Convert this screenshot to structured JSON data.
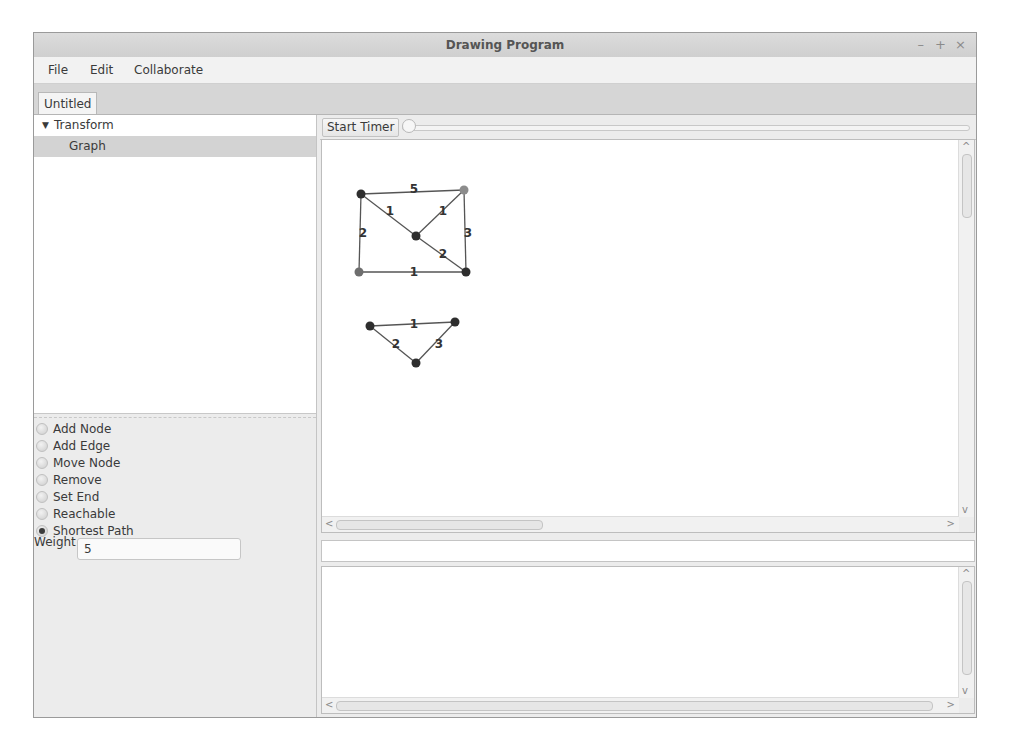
{
  "window": {
    "title": "Drawing Program",
    "controls": {
      "minimize": "–",
      "maximize": "+",
      "close": "×"
    }
  },
  "menubar": {
    "items": [
      "File",
      "Edit",
      "Collaborate"
    ]
  },
  "tabs": [
    {
      "label": "Untitled",
      "active": true
    }
  ],
  "tree": {
    "items": [
      {
        "label": "Transform",
        "expanded": true,
        "toggle": "▼",
        "level": 0,
        "selected": false
      },
      {
        "label": "Graph",
        "level": 1,
        "selected": true
      }
    ]
  },
  "tools": {
    "modes": [
      {
        "label": "Add Node",
        "selected": false
      },
      {
        "label": "Add Edge",
        "selected": false
      },
      {
        "label": "Move Node",
        "selected": false
      },
      {
        "label": "Remove",
        "selected": false
      },
      {
        "label": "Set End",
        "selected": false
      },
      {
        "label": "Reachable",
        "selected": false
      },
      {
        "label": "Shortest Path",
        "selected": true
      }
    ],
    "weight_label": "Weight",
    "weight_value": "5"
  },
  "toolbar": {
    "start_timer_label": "Start Timer",
    "slider_value": 0
  },
  "canvas": {
    "graphs": [
      {
        "nodes": [
          {
            "id": "a",
            "x": 39,
            "y": 54,
            "color": "#2e2e2e"
          },
          {
            "id": "b",
            "x": 142,
            "y": 50,
            "color": "#8c8c8c"
          },
          {
            "id": "c",
            "x": 94,
            "y": 96,
            "color": "#2e2e2e"
          },
          {
            "id": "d",
            "x": 37,
            "y": 132,
            "color": "#6e6e6e"
          },
          {
            "id": "e",
            "x": 144,
            "y": 132,
            "color": "#2e2e2e"
          }
        ],
        "edges": [
          {
            "from": "a",
            "to": "b",
            "weight": "5",
            "lx": 92,
            "ly": 49
          },
          {
            "from": "a",
            "to": "c",
            "weight": "1",
            "lx": 68,
            "ly": 71
          },
          {
            "from": "a",
            "to": "d",
            "weight": "2",
            "lx": 41,
            "ly": 93
          },
          {
            "from": "b",
            "to": "c",
            "weight": "1",
            "lx": 121,
            "ly": 71
          },
          {
            "from": "b",
            "to": "e",
            "weight": "3",
            "lx": 146,
            "ly": 93
          },
          {
            "from": "c",
            "to": "e",
            "weight": "2",
            "lx": 121,
            "ly": 114
          },
          {
            "from": "d",
            "to": "e",
            "weight": "1",
            "lx": 92,
            "ly": 132
          }
        ]
      },
      {
        "nodes": [
          {
            "id": "f",
            "x": 48,
            "y": 186,
            "color": "#2e2e2e"
          },
          {
            "id": "g",
            "x": 133,
            "y": 182,
            "color": "#2e2e2e"
          },
          {
            "id": "h",
            "x": 94,
            "y": 223,
            "color": "#2e2e2e"
          }
        ],
        "edges": [
          {
            "from": "f",
            "to": "g",
            "weight": "1",
            "lx": 92,
            "ly": 184
          },
          {
            "from": "f",
            "to": "h",
            "weight": "2",
            "lx": 74,
            "ly": 204
          },
          {
            "from": "g",
            "to": "h",
            "weight": "3",
            "lx": 117,
            "ly": 204
          }
        ]
      }
    ]
  },
  "status_field": {
    "value": ""
  },
  "log": {
    "text": ""
  },
  "colors": {
    "titlebar": "#d4d4d4",
    "selected_row": "#d3d3d3",
    "edge": "#555555"
  }
}
